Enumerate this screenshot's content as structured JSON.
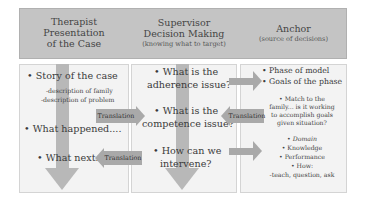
{
  "headers": [
    {
      "title_line1": "Therapist Presentation",
      "title_line2": "of the Case",
      "subtitle": ""
    },
    {
      "title_line1": "Supervisor",
      "title_line2": "Decision Making",
      "subtitle": "(knowing what to target)"
    },
    {
      "title_line1": "Anchor",
      "title_line2": "",
      "subtitle": "(source of decisions)"
    }
  ],
  "therapist": {
    "story": "• Story of the case",
    "desc_family": "-description of family",
    "desc_problem": "-description of problem",
    "what_happened": "• What happened....",
    "what_next": "• What next.."
  },
  "supervisor": {
    "adherence_l1": "• What is the",
    "adherence_l2": "adherence issue?",
    "competence_l1": "• What is the",
    "competence_l2": "competence issue?",
    "intervene_l1": "• How can we",
    "intervene_l2": "intervene?"
  },
  "anchor": {
    "phase": "• Phase of model",
    "goals": "• Goals of the phase",
    "match_l1": "• Match to the",
    "match_l2": "family... is it working",
    "match_l3": "to accomplish goals",
    "match_l4": "given situation?",
    "domain": "• Domain",
    "knowledge": "• Knowledge",
    "performance": "• Performance",
    "how": "• How:",
    "how_detail": "-teach, question, ask"
  },
  "arrows": {
    "translation_1": "Translation",
    "translation_2": "Translation",
    "translation_3": "Translation"
  },
  "colors": {
    "header_fill": "#c4c4c4",
    "box_fill": "#f3f3f3",
    "arrow_fill": "#a9a9a9"
  }
}
